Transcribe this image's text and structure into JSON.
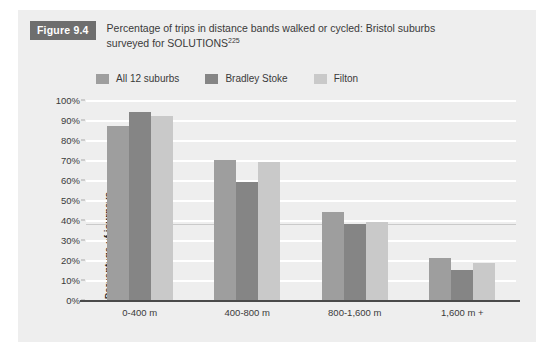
{
  "figure": {
    "badge": "Figure 9.4",
    "title_line1": "Percentage of trips in distance bands walked or cycled: Bristol suburbs",
    "title_line2": "surveyed for SOLUTIONS",
    "title_superscript": "225"
  },
  "colors": {
    "panel_background": "#eeeeee",
    "badge_background": "#6e6e6e",
    "series_1": "#9e9e9e",
    "series_2": "#858585",
    "series_3": "#c9c9c9",
    "gridline": "#ffffff",
    "axis": "#4a4a4a",
    "text": "#3a3a3a"
  },
  "chart_data": {
    "type": "bar",
    "title": "Percentage of trips in distance bands walked or cycled: Bristol suburbs surveyed for SOLUTIONS",
    "xlabel": "",
    "ylabel": "Percentage of journeys",
    "categories": [
      "0-400 m",
      "400-800 m",
      "800-1,600 m",
      "1,600 m +"
    ],
    "series": [
      {
        "name": "All 12 suburbs",
        "color": "#9e9e9e",
        "values": [
          87,
          70,
          44,
          21
        ]
      },
      {
        "name": "Bradley Stoke",
        "color": "#858585",
        "values": [
          94,
          59,
          38,
          15
        ]
      },
      {
        "name": "Filton",
        "color": "#c9c9c9",
        "values": [
          92,
          69,
          39,
          18.5
        ]
      }
    ],
    "ylim": [
      0,
      100
    ],
    "ytick_labels": [
      "0%",
      "10%",
      "20%",
      "30%",
      "40%",
      "50%",
      "60%",
      "70%",
      "80%",
      "90%",
      "100%"
    ],
    "ytick_values": [
      0,
      10,
      20,
      30,
      40,
      50,
      60,
      70,
      80,
      90,
      100
    ],
    "grid": true,
    "legend_position": "top"
  }
}
